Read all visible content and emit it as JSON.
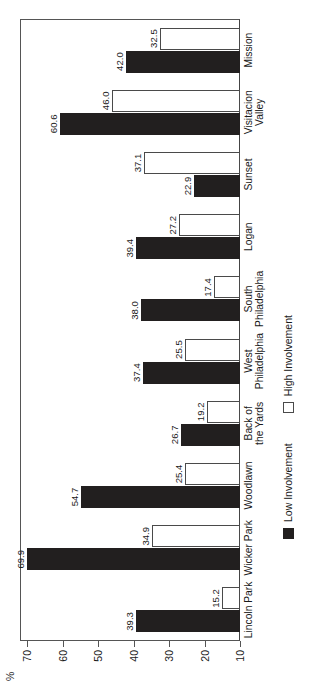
{
  "chart_data": {
    "type": "bar",
    "title": "",
    "subtitle": "",
    "xlabel": "",
    "ylabel": "%",
    "ylim": [
      10,
      72
    ],
    "yticks": [
      70,
      60,
      50,
      40,
      30,
      20,
      10
    ],
    "ytick_labels": [
      "70",
      "60",
      "50",
      "40",
      "30",
      "20",
      "10"
    ],
    "grid": false,
    "orientation": "horizontal-rotated",
    "legend_position": "bottom",
    "categories": [
      "Lincoln Park",
      "Wicker Park",
      "Woodlawn",
      "Back of\nthe Yards",
      "West\nPhiladelphia",
      "South\nPhiladelphia",
      "Logan",
      "Sunset",
      "Visitacion\nValley",
      "Mission"
    ],
    "series": [
      {
        "name": "Low Involvement",
        "color": "#221f1f",
        "values": [
          39.3,
          69.9,
          54.7,
          26.7,
          37.4,
          38.0,
          39.4,
          22.9,
          60.6,
          42.0
        ],
        "labels": [
          "39.3",
          "69.9",
          "54.7",
          "26.7",
          "37.4",
          "38.0",
          "39.4",
          "22.9",
          "60.6",
          "42.0"
        ]
      },
      {
        "name": "High Involvement",
        "color": "#ffffff",
        "values": [
          15.2,
          34.9,
          25.4,
          19.2,
          25.5,
          17.4,
          27.2,
          37.1,
          46.0,
          32.5
        ],
        "labels": [
          "15.2",
          "34.9",
          "25.4",
          "19.2",
          "25.5",
          "17.4",
          "27.2",
          "37.1",
          "46.0",
          "32.5"
        ]
      }
    ]
  },
  "axis": {
    "unit_label": "%"
  },
  "legend": {
    "entries": [
      {
        "label": "Low Involvement",
        "swatch": "filled-black-square"
      },
      {
        "label": "High Involvement",
        "swatch": "open-white-square"
      }
    ]
  }
}
